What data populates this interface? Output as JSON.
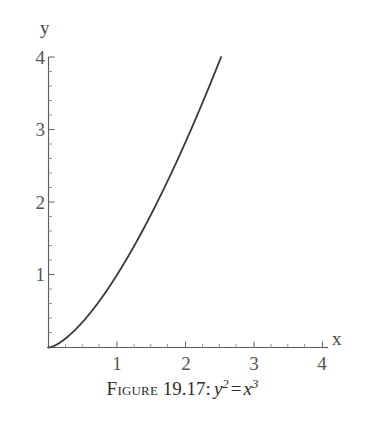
{
  "figure": {
    "caption_label": "Figure",
    "caption_number": "19.17:",
    "equation": {
      "lhs_base": "y",
      "lhs_exp": "2",
      "operator": "=",
      "rhs_base": "x",
      "rhs_exp": "3",
      "plain": "y^2 = x^3"
    }
  },
  "axes": {
    "x_label": "x",
    "y_label": "y",
    "x_ticks": [
      "1",
      "2",
      "3",
      "4"
    ],
    "y_ticks": [
      "1",
      "2",
      "3",
      "4"
    ]
  },
  "colors": {
    "curve": "#3a3a3a",
    "axis": "#5a5a5a",
    "tick_label": "#555555",
    "caption": "#2e2e2e",
    "background": "#ffffff"
  },
  "chart_data": {
    "type": "line",
    "title": "",
    "subtitle": "",
    "xlabel": "x",
    "ylabel": "y",
    "xlim": [
      0,
      4
    ],
    "ylim": [
      0,
      4
    ],
    "xticks": [
      1,
      2,
      3,
      4
    ],
    "yticks": [
      1,
      2,
      3,
      4
    ],
    "minor_ticks_per_interval": 4,
    "grid": false,
    "legend": null,
    "annotation": "y^2 = x^3",
    "series": [
      {
        "name": "y = x^(3/2)",
        "x": [
          0,
          0.1,
          0.2,
          0.3,
          0.4,
          0.5,
          0.6,
          0.7,
          0.8,
          0.9,
          1.0,
          1.2,
          1.4,
          1.6,
          1.8,
          2.0,
          2.2,
          2.4,
          2.5198
        ],
        "y": [
          0,
          0.0316,
          0.0894,
          0.1643,
          0.253,
          0.3536,
          0.4648,
          0.5857,
          0.7155,
          0.8538,
          1.0,
          1.3145,
          1.6565,
          2.024,
          2.4152,
          2.8284,
          3.2634,
          3.7181,
          4.0
        ]
      }
    ]
  }
}
